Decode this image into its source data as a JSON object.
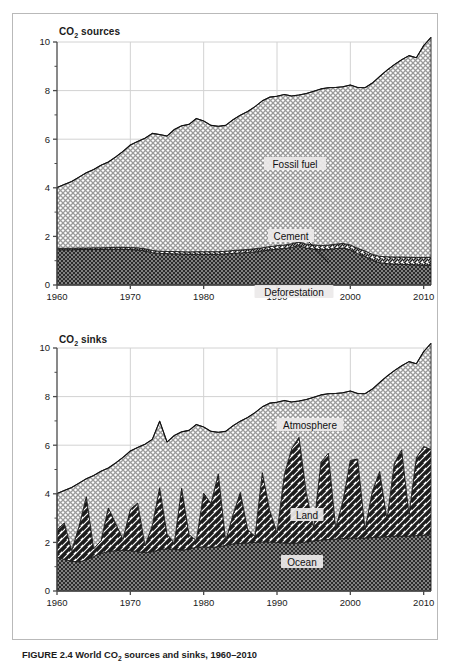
{
  "figure": {
    "caption_prefix": "FIGURE 2.4",
    "caption_text_a": " World CO",
    "caption_sub": "2",
    "caption_text_b": " sources and sinks, 1960–2010"
  },
  "panels": [
    {
      "id": "sources",
      "title_main": "CO",
      "title_sub": "2",
      "title_rest": " sources",
      "labels": [
        {
          "name": "fossil-fuel",
          "text": "Fossil fuel"
        },
        {
          "name": "cement",
          "text": "Cement"
        },
        {
          "name": "deforestation",
          "text": "Deforestation"
        }
      ]
    },
    {
      "id": "sinks",
      "title_main": "CO",
      "title_sub": "2",
      "title_rest": " sinks",
      "labels": [
        {
          "name": "atmosphere",
          "text": "Atmosphere"
        },
        {
          "name": "land",
          "text": "Land"
        },
        {
          "name": "ocean",
          "text": "Ocean"
        }
      ]
    }
  ],
  "axes": {
    "y_ticks": [
      "0",
      "2",
      "4",
      "6",
      "8",
      "10"
    ],
    "y_tick_values": [
      0,
      2,
      4,
      6,
      8,
      10
    ],
    "y_minor_values": [
      1,
      3,
      5,
      7,
      9
    ],
    "x_ticks": [
      "1960",
      "1970",
      "1980",
      "1990",
      "2000",
      "2010"
    ],
    "x_tick_values": [
      1960,
      1970,
      1980,
      1990,
      2000,
      2010
    ],
    "xlim": [
      1960,
      2011
    ],
    "ylim": [
      0,
      10
    ],
    "grid": true
  },
  "colors": {
    "frame": "#b9b9b9",
    "axis": "#4a4a4a",
    "grid": "#d2d2d2",
    "text": "#1b1b1b",
    "light_hatch": "#9a9a9a",
    "dark_fill": "#2b2b2b",
    "label_box": "#eceaea"
  },
  "chart_data": [
    {
      "type": "area",
      "stacked": true,
      "title": "CO2 sources",
      "xlabel": "",
      "ylabel": "",
      "xlim": [
        1960,
        2011
      ],
      "ylim": [
        0,
        10
      ],
      "grid": true,
      "legend_position": "inline-annotations",
      "x": [
        1960,
        1961,
        1962,
        1963,
        1964,
        1965,
        1966,
        1967,
        1968,
        1969,
        1970,
        1971,
        1972,
        1973,
        1974,
        1975,
        1976,
        1977,
        1978,
        1979,
        1980,
        1981,
        1982,
        1983,
        1984,
        1985,
        1986,
        1987,
        1988,
        1989,
        1990,
        1991,
        1992,
        1993,
        1994,
        1995,
        1996,
        1997,
        1998,
        1999,
        2000,
        2001,
        2002,
        2003,
        2004,
        2005,
        2006,
        2007,
        2008,
        2009,
        2010,
        2011
      ],
      "series": [
        {
          "name": "Deforestation",
          "pattern": "dark-dotted",
          "values": [
            1.45,
            1.45,
            1.45,
            1.46,
            1.46,
            1.46,
            1.46,
            1.47,
            1.47,
            1.47,
            1.46,
            1.44,
            1.4,
            1.33,
            1.3,
            1.29,
            1.28,
            1.27,
            1.26,
            1.26,
            1.26,
            1.26,
            1.26,
            1.28,
            1.3,
            1.32,
            1.34,
            1.36,
            1.4,
            1.44,
            1.48,
            1.5,
            1.55,
            1.62,
            1.52,
            1.48,
            1.45,
            1.46,
            1.5,
            1.52,
            1.45,
            1.3,
            1.18,
            1.02,
            0.92,
            0.88,
            0.86,
            0.85,
            0.84,
            0.83,
            0.82,
            0.82
          ]
        },
        {
          "name": "Cement",
          "pattern": "diagonal-hatch-white",
          "values": [
            0.06,
            0.06,
            0.06,
            0.06,
            0.06,
            0.07,
            0.07,
            0.07,
            0.08,
            0.08,
            0.08,
            0.09,
            0.09,
            0.09,
            0.09,
            0.09,
            0.1,
            0.1,
            0.1,
            0.11,
            0.11,
            0.11,
            0.11,
            0.11,
            0.12,
            0.12,
            0.12,
            0.13,
            0.13,
            0.14,
            0.14,
            0.14,
            0.15,
            0.15,
            0.16,
            0.17,
            0.17,
            0.18,
            0.18,
            0.19,
            0.2,
            0.21,
            0.22,
            0.24,
            0.26,
            0.28,
            0.29,
            0.3,
            0.3,
            0.3,
            0.31,
            0.32
          ]
        },
        {
          "name": "Fossil fuel",
          "pattern": "light-crosshatch",
          "values": [
            2.5,
            2.63,
            2.75,
            2.92,
            3.1,
            3.22,
            3.4,
            3.52,
            3.72,
            3.95,
            4.22,
            4.38,
            4.55,
            4.82,
            4.8,
            4.75,
            5.02,
            5.18,
            5.25,
            5.48,
            5.38,
            5.2,
            5.16,
            5.18,
            5.38,
            5.55,
            5.68,
            5.85,
            6.05,
            6.15,
            6.15,
            6.2,
            6.08,
            6.05,
            6.2,
            6.32,
            6.45,
            6.48,
            6.45,
            6.45,
            6.58,
            6.62,
            6.72,
            7.05,
            7.4,
            7.68,
            7.92,
            8.12,
            8.3,
            8.22,
            8.72,
            9.05
          ]
        }
      ],
      "totals": [
        4.01,
        4.14,
        4.26,
        4.44,
        4.62,
        4.75,
        4.93,
        5.06,
        5.27,
        5.5,
        5.76,
        5.91,
        6.04,
        6.24,
        6.19,
        6.13,
        6.4,
        6.55,
        6.61,
        6.85,
        6.75,
        6.57,
        6.53,
        6.57,
        6.8,
        6.99,
        7.14,
        7.34,
        7.58,
        7.73,
        7.77,
        7.84,
        7.78,
        7.82,
        7.88,
        7.97,
        8.07,
        8.12,
        8.13,
        8.16,
        8.23,
        8.13,
        8.12,
        8.31,
        8.58,
        8.84,
        9.07,
        9.27,
        9.44,
        9.35,
        9.85,
        10.19
      ]
    },
    {
      "type": "area",
      "stacked": true,
      "title": "CO2 sinks",
      "xlabel": "",
      "ylabel": "",
      "xlim": [
        1960,
        2011
      ],
      "ylim": [
        0,
        10
      ],
      "grid": true,
      "legend_position": "inline-annotations",
      "x": [
        1960,
        1961,
        1962,
        1963,
        1964,
        1965,
        1966,
        1967,
        1968,
        1969,
        1970,
        1971,
        1972,
        1973,
        1974,
        1975,
        1976,
        1977,
        1978,
        1979,
        1980,
        1981,
        1982,
        1983,
        1984,
        1985,
        1986,
        1987,
        1988,
        1989,
        1990,
        1991,
        1992,
        1993,
        1994,
        1995,
        1996,
        1997,
        1998,
        1999,
        2000,
        2001,
        2002,
        2003,
        2004,
        2005,
        2006,
        2007,
        2008,
        2009,
        2010,
        2011
      ],
      "series": [
        {
          "name": "Ocean",
          "pattern": "dark-dotted",
          "values": [
            1.4,
            1.3,
            1.22,
            1.2,
            1.28,
            1.42,
            1.55,
            1.62,
            1.66,
            1.68,
            1.66,
            1.62,
            1.58,
            1.62,
            1.7,
            1.74,
            1.72,
            1.68,
            1.72,
            1.8,
            1.82,
            1.8,
            1.82,
            1.88,
            1.94,
            1.96,
            1.98,
            2.0,
            2.02,
            2.02,
            2.0,
            1.98,
            1.96,
            1.98,
            2.02,
            2.06,
            2.1,
            2.12,
            2.14,
            2.16,
            2.18,
            2.18,
            2.18,
            2.2,
            2.22,
            2.24,
            2.26,
            2.26,
            2.26,
            2.28,
            2.3,
            2.32
          ]
        },
        {
          "name": "Land",
          "pattern": "bold-diagonal-stripes",
          "values": [
            1.12,
            1.5,
            0.45,
            1.45,
            2.6,
            0.32,
            0.52,
            1.8,
            1.12,
            0.45,
            1.7,
            2.0,
            0.28,
            1.08,
            2.55,
            0.6,
            0.25,
            2.55,
            0.6,
            0.28,
            2.2,
            1.8,
            3.0,
            0.18,
            1.2,
            2.1,
            0.55,
            0.25,
            2.85,
            1.3,
            0.4,
            2.8,
            3.9,
            4.35,
            2.0,
            0.55,
            3.2,
            3.55,
            0.45,
            1.55,
            3.2,
            3.25,
            0.35,
            1.9,
            2.7,
            0.7,
            3.0,
            3.55,
            0.9,
            3.2,
            3.65,
            3.5
          ]
        },
        {
          "name": "Atmosphere",
          "pattern": "light-crosshatch",
          "values": [
            1.49,
            1.34,
            2.59,
            1.79,
            0.74,
            3.01,
            2.86,
            1.64,
            2.49,
            3.37,
            2.4,
            2.29,
            4.18,
            3.54,
            2.74,
            3.79,
            4.43,
            2.32,
            4.29,
            4.77,
            2.73,
            2.97,
            1.71,
            4.51,
            3.66,
            2.93,
            4.61,
            5.09,
            2.71,
            4.41,
            5.37,
            3.06,
            1.92,
            1.49,
            3.86,
            5.36,
            2.77,
            2.45,
            5.54,
            4.45,
            2.85,
            2.7,
            5.59,
            4.21,
            3.66,
            5.9,
            3.81,
            3.46,
            6.28,
            3.87,
            3.9,
            4.37
          ]
        }
      ],
      "totals": [
        4.01,
        4.14,
        4.26,
        4.44,
        4.62,
        4.75,
        4.93,
        5.06,
        5.27,
        5.5,
        5.76,
        5.91,
        6.04,
        6.24,
        6.19,
        6.13,
        6.4,
        6.55,
        6.61,
        6.85,
        6.75,
        6.57,
        6.53,
        6.57,
        6.8,
        6.99,
        7.14,
        7.34,
        7.58,
        7.73,
        7.77,
        7.84,
        7.78,
        7.82,
        7.88,
        7.97,
        8.07,
        8.12,
        8.13,
        8.16,
        8.23,
        8.13,
        8.12,
        8.31,
        8.58,
        8.84,
        9.07,
        9.27,
        9.44,
        9.35,
        9.85,
        10.19
      ]
    }
  ]
}
